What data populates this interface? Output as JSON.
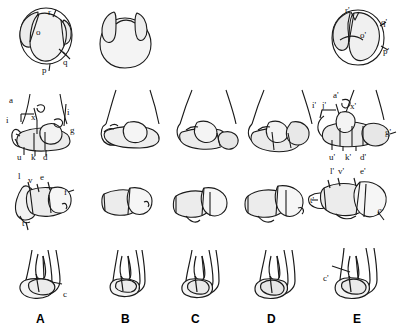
{
  "figure": {
    "caption_letters": [
      "A",
      "B",
      "C",
      "D",
      "E"
    ],
    "stroke_color": "#1a1a1a",
    "fill_color": "#e9e9e9",
    "fill_color_dark": "#d8d8d8",
    "background": "#ffffff",
    "rows": 4,
    "columns": 5
  },
  "columns": [
    {
      "letter": "A",
      "x": 42
    },
    {
      "letter": "B",
      "x": 126
    },
    {
      "letter": "C",
      "x": 196
    },
    {
      "letter": "D",
      "x": 272
    },
    {
      "letter": "E",
      "x": 358
    }
  ],
  "row1": {
    "name": "proximal-view",
    "specimens": [
      {
        "column": "A",
        "labels": [
          {
            "text": "r",
            "x": 48,
            "y": 8
          },
          {
            "text": "o",
            "x": 36,
            "y": 28
          },
          {
            "text": "q",
            "x": 63,
            "y": 58
          },
          {
            "text": "p",
            "x": 42,
            "y": 66
          }
        ]
      },
      {
        "column": "B",
        "labels": []
      },
      {
        "column": "E",
        "labels": [
          {
            "text": "r'",
            "x": 345,
            "y": 6
          },
          {
            "text": "q'",
            "x": 381,
            "y": 18
          },
          {
            "text": "o'",
            "x": 360,
            "y": 31
          },
          {
            "text": "p'",
            "x": 383,
            "y": 47
          }
        ]
      }
    ]
  },
  "row2": {
    "name": "distal-anterior-view",
    "specimens": [
      {
        "column": "A",
        "labels": [
          {
            "text": "a",
            "x": 9,
            "y": 96
          },
          {
            "text": "i",
            "x": 6,
            "y": 116
          },
          {
            "text": "x",
            "x": 31,
            "y": 113
          },
          {
            "text": "i",
            "x": 67,
            "y": 108
          },
          {
            "text": "g",
            "x": 70,
            "y": 126
          },
          {
            "text": "u",
            "x": 17,
            "y": 153
          },
          {
            "text": "k",
            "x": 31,
            "y": 153
          },
          {
            "text": "d",
            "x": 43,
            "y": 153
          }
        ]
      },
      {
        "column": "B",
        "labels": []
      },
      {
        "column": "C",
        "labels": []
      },
      {
        "column": "D",
        "labels": []
      },
      {
        "column": "E",
        "labels": [
          {
            "text": "a'",
            "x": 333,
            "y": 91
          },
          {
            "text": "i'",
            "x": 312,
            "y": 101
          },
          {
            "text": "j'",
            "x": 322,
            "y": 101
          },
          {
            "text": "x'",
            "x": 350,
            "y": 102
          },
          {
            "text": "g'",
            "x": 385,
            "y": 128
          },
          {
            "text": "u'",
            "x": 329,
            "y": 153
          },
          {
            "text": "k'",
            "x": 345,
            "y": 153
          },
          {
            "text": "d'",
            "x": 360,
            "y": 153
          }
        ]
      }
    ]
  },
  "row3": {
    "name": "lateral-view",
    "specimens": [
      {
        "column": "A",
        "labels": [
          {
            "text": "l",
            "x": 18,
            "y": 172
          },
          {
            "text": "v",
            "x": 28,
            "y": 176
          },
          {
            "text": "e",
            "x": 40,
            "y": 173
          },
          {
            "text": "f",
            "x": 64,
            "y": 188
          },
          {
            "text": "t",
            "x": 22,
            "y": 219
          }
        ]
      },
      {
        "column": "B",
        "labels": []
      },
      {
        "column": "C",
        "labels": []
      },
      {
        "column": "D",
        "labels": []
      },
      {
        "column": "E",
        "labels": [
          {
            "text": "l'",
            "x": 330,
            "y": 167
          },
          {
            "text": "v'",
            "x": 338,
            "y": 167
          },
          {
            "text": "e'",
            "x": 360,
            "y": 167
          },
          {
            "text": "t'",
            "x": 310,
            "y": 196
          },
          {
            "text": "f'",
            "x": 377,
            "y": 208
          }
        ]
      }
    ]
  },
  "row4": {
    "name": "distal-oblique-view",
    "specimens": [
      {
        "column": "A",
        "labels": [
          {
            "text": "c",
            "x": 63,
            "y": 290
          }
        ]
      },
      {
        "column": "B",
        "labels": []
      },
      {
        "column": "C",
        "labels": []
      },
      {
        "column": "D",
        "labels": []
      },
      {
        "column": "E",
        "labels": [
          {
            "text": "c'",
            "x": 323,
            "y": 274
          }
        ]
      }
    ]
  }
}
